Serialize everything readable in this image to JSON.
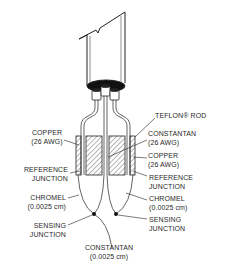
{
  "diagram": {
    "labels": {
      "teflon_rod": "TEFLON® ROD",
      "copper_left": [
        "COPPER",
        "(26 AWG)"
      ],
      "reference_junction_left": [
        "REFERENCE",
        "JUNCTION"
      ],
      "chromel_left": [
        "CHROMEL",
        "(0.0025 cm)"
      ],
      "sensing_junction_left": [
        "SENSING",
        "JUNCTION"
      ],
      "constantan_bottom": [
        "CONSTANTAN",
        "(0.0025 cm)"
      ],
      "constantan_right": [
        "CONSTANTAN",
        "(26 AWG)"
      ],
      "copper_right": [
        "COPPER",
        "(26 AWG)"
      ],
      "reference_junction_right": [
        "REFERENCE",
        "JUNCTION"
      ],
      "chromel_right": [
        "CHROMEL",
        "(0.0025 cm)"
      ],
      "sensing_junction_right": [
        "SENSING",
        "JUNCTION"
      ]
    },
    "colors": {
      "line": "#222222",
      "background": "#ffffff"
    }
  }
}
